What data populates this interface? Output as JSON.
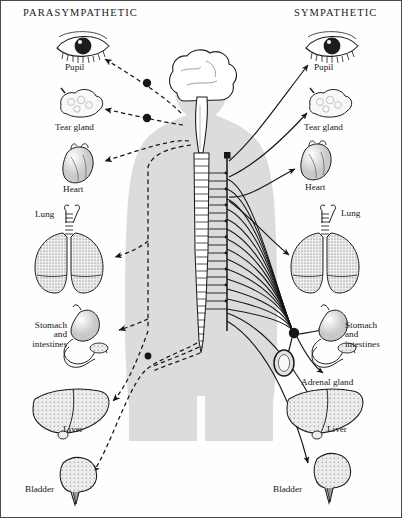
{
  "diagram": {
    "type": "anatomical-schematic",
    "background_color": "#fefefe",
    "silhouette_color": "#dcdcdc",
    "ink_color": "#161616"
  },
  "headers": {
    "left": "PARASYMPATHETIC",
    "right": "SYMPATHETIC"
  },
  "columns": {
    "left": {
      "division": "PARASYMPATHETIC",
      "line_style": "dashed",
      "organs": [
        {
          "name": "pupil",
          "label": "Pupil",
          "x": 82,
          "y": 62
        },
        {
          "name": "tear-gland",
          "label": "Tear gland",
          "x": 82,
          "y": 122
        },
        {
          "name": "heart",
          "label": "Heart",
          "x": 82,
          "y": 185
        },
        {
          "name": "lung",
          "label": "Lung",
          "x": 50,
          "y": 213
        },
        {
          "name": "stomach-intestines",
          "label": "Stomach\nand\nintestines",
          "x": 50,
          "y": 330
        },
        {
          "name": "liver",
          "label": "Liver",
          "x": 72,
          "y": 429
        },
        {
          "name": "bladder",
          "label": "Bladder",
          "x": 52,
          "y": 492
        }
      ]
    },
    "right": {
      "division": "SYMPATHETIC",
      "line_style": "solid",
      "organs": [
        {
          "name": "pupil",
          "label": "Pupil",
          "x": 331,
          "y": 62
        },
        {
          "name": "tear-gland",
          "label": "Tear gland",
          "x": 331,
          "y": 123
        },
        {
          "name": "heart",
          "label": "Heart",
          "x": 318,
          "y": 182
        },
        {
          "name": "lung",
          "label": "Lung",
          "x": 355,
          "y": 212
        },
        {
          "name": "stomach-intestines",
          "label": "Stomach\nand\nintestines",
          "x": 356,
          "y": 330
        },
        {
          "name": "adrenal-gland",
          "label": "Adrenal gland",
          "x": 316,
          "y": 382
        },
        {
          "name": "liver",
          "label": "Liver",
          "x": 337,
          "y": 429
        },
        {
          "name": "bladder",
          "label": "Bladder",
          "x": 300,
          "y": 490
        }
      ]
    }
  },
  "central": {
    "brain": {
      "name": "brain",
      "cx": 198,
      "cy": 90
    },
    "brainstem": {
      "name": "brainstem",
      "x": 200,
      "y": 110
    },
    "spinal_cord": {
      "name": "spinal-cord",
      "top": 150,
      "bottom": 352,
      "segments": 30
    },
    "sympathetic_chain": {
      "name": "sympathetic-chain-ganglia",
      "x": 226,
      "top": 152,
      "bottom": 330
    },
    "collateral_ganglion": {
      "name": "collateral-ganglion",
      "cx": 293,
      "cy": 332
    }
  },
  "ganglia": {
    "parasympathetic_dots": [
      {
        "name": "ciliary-ganglion",
        "cx": 146,
        "cy": 82
      },
      {
        "name": "pterygopalatine-ganglion",
        "cx": 146,
        "cy": 117
      }
    ]
  }
}
